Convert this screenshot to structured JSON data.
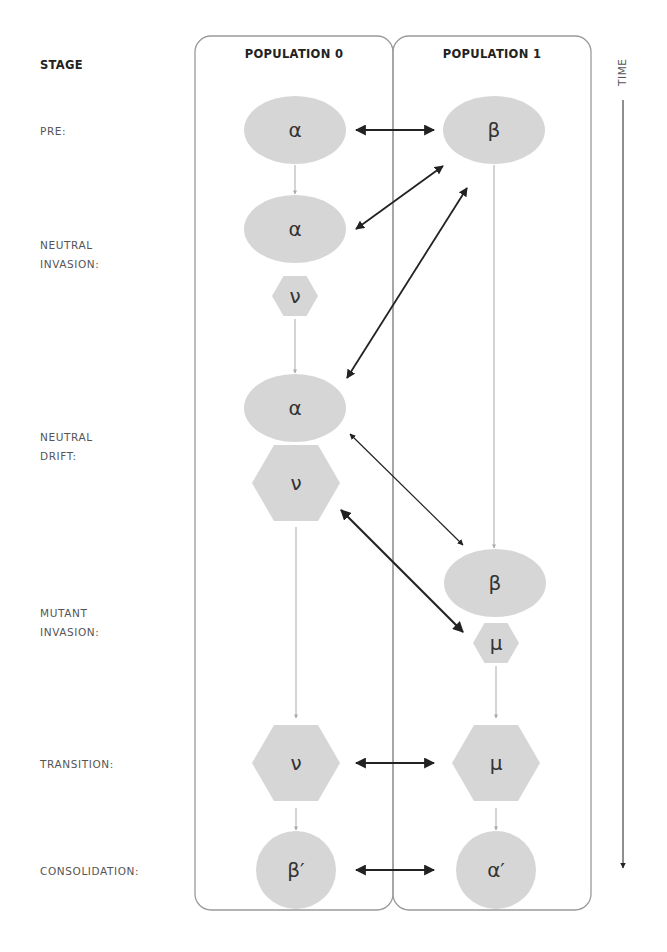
{
  "header": {
    "stage": "STAGE",
    "population_0": "POPULATION 0",
    "population_1": "POPULATION 1",
    "time": "TIME"
  },
  "stages": [
    {
      "label": "PRE:",
      "y": 122
    },
    {
      "label": "NEUTRAL\nINVASION:",
      "y": 236
    },
    {
      "label": "NEUTRAL\nDRIFT:",
      "y": 428
    },
    {
      "label": "MUTANT\nINVASION:",
      "y": 604
    },
    {
      "label": "TRANSITION:",
      "y": 755
    },
    {
      "label": "CONSOLIDATION:",
      "y": 862
    }
  ],
  "colors": {
    "node_fill": "#d6d6d6",
    "box_stroke": "#9a9a9a",
    "arrow": "#222222",
    "flow_arrow": "#aaaaaa"
  },
  "boxes": [
    {
      "name": "population-0-box",
      "x": 195,
      "y": 36,
      "w": 198,
      "h": 874
    },
    {
      "name": "population-1-box",
      "x": 393,
      "y": 36,
      "w": 198,
      "h": 874
    }
  ],
  "nodes": [
    {
      "id": "pre-alpha",
      "shape": "ellipse",
      "symbol": "α",
      "cx": 295,
      "cy": 130,
      "rx": 51,
      "ry": 34
    },
    {
      "id": "pre-beta",
      "shape": "ellipse",
      "symbol": "β",
      "cx": 494,
      "cy": 130,
      "rx": 51,
      "ry": 34
    },
    {
      "id": "ni-alpha",
      "shape": "ellipse",
      "symbol": "α",
      "cx": 295,
      "cy": 229,
      "rx": 51,
      "ry": 34
    },
    {
      "id": "ni-nu",
      "shape": "hexagon",
      "symbol": "ν",
      "cx": 295,
      "cy": 296,
      "r": 23
    },
    {
      "id": "nd-alpha",
      "shape": "ellipse",
      "symbol": "α",
      "cx": 295,
      "cy": 408,
      "rx": 51,
      "ry": 34
    },
    {
      "id": "nd-nu",
      "shape": "hexagon",
      "symbol": "ν",
      "cx": 296,
      "cy": 483,
      "r": 44
    },
    {
      "id": "mi-beta",
      "shape": "ellipse",
      "symbol": "β",
      "cx": 495,
      "cy": 583,
      "rx": 51,
      "ry": 34
    },
    {
      "id": "mi-mu",
      "shape": "hexagon",
      "symbol": "μ",
      "cx": 496,
      "cy": 643,
      "r": 23
    },
    {
      "id": "tr-nu",
      "shape": "hexagon",
      "symbol": "ν",
      "cx": 296,
      "cy": 763,
      "r": 44
    },
    {
      "id": "tr-mu",
      "shape": "hexagon",
      "symbol": "μ",
      "cx": 496,
      "cy": 763,
      "r": 44
    },
    {
      "id": "co-beta-prime",
      "shape": "ellipse",
      "symbol": "β′",
      "cx": 296,
      "cy": 870,
      "rx": 40,
      "ry": 39
    },
    {
      "id": "co-alpha-prime",
      "shape": "ellipse",
      "symbol": "α′",
      "cx": 496,
      "cy": 870,
      "rx": 40,
      "ry": 39
    }
  ],
  "flow_arrows": [
    {
      "x": 295,
      "y1": 165,
      "y2": 194
    },
    {
      "x": 295,
      "y1": 319,
      "y2": 373
    },
    {
      "x": 296,
      "y1": 527,
      "y2": 718
    },
    {
      "x": 296,
      "y1": 808,
      "y2": 830
    },
    {
      "x": 494,
      "y1": 165,
      "y2": 548
    },
    {
      "x": 496,
      "y1": 666,
      "y2": 718
    },
    {
      "x": 496,
      "y1": 808,
      "y2": 830
    }
  ],
  "interaction_arrows": [
    {
      "x1": 356,
      "y1": 130,
      "x2": 434,
      "y2": 130,
      "width": 2.2
    },
    {
      "x1": 356,
      "y1": 229,
      "x2": 443,
      "y2": 166,
      "width": 1.8
    },
    {
      "x1": 347,
      "y1": 378,
      "x2": 467,
      "y2": 188,
      "width": 1.8
    },
    {
      "x1": 350,
      "y1": 434,
      "x2": 463,
      "y2": 545,
      "width": 1.2
    },
    {
      "x1": 341,
      "y1": 510,
      "x2": 463,
      "y2": 632,
      "width": 2.2
    },
    {
      "x1": 356,
      "y1": 763,
      "x2": 434,
      "y2": 763,
      "width": 2.2
    },
    {
      "x1": 356,
      "y1": 870,
      "x2": 434,
      "y2": 870,
      "width": 2.2
    }
  ],
  "time_axis": {
    "x": 623,
    "y1": 100,
    "y2": 868
  }
}
